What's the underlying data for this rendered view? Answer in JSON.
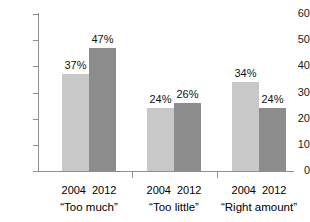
{
  "chart_data": {
    "type": "bar",
    "title": "",
    "subtitle": "",
    "xlabel": "",
    "ylabel": "",
    "ylim": [
      0,
      60
    ],
    "ytick_labels": [
      "0",
      "10",
      "20",
      "30",
      "40",
      "50",
      "60"
    ],
    "ytick_values": [
      0,
      10,
      20,
      30,
      40,
      50,
      60
    ],
    "grid": false,
    "legend_position": "none",
    "categories": [
      "“Too much”",
      "“Too little”",
      "“Right amount”"
    ],
    "series": [
      {
        "name": "2004",
        "color": "#c8c8c8",
        "values": [
          37,
          24,
          34
        ],
        "data_labels": [
          "37%",
          "24%",
          "34%"
        ]
      },
      {
        "name": "2012",
        "color": "#8c8c8c",
        "values": [
          47,
          26,
          24
        ],
        "data_labels": [
          "47%",
          "26%",
          "24%"
        ]
      }
    ],
    "groups": [
      {
        "category": "“Too much”",
        "bars": [
          {
            "series": "2004",
            "value": 37,
            "label": "37%"
          },
          {
            "series": "2012",
            "value": 47,
            "label": "47%"
          }
        ]
      },
      {
        "category": "“Too little”",
        "bars": [
          {
            "series": "2004",
            "value": 24,
            "label": "24%"
          },
          {
            "series": "2012",
            "value": 26,
            "label": "26%"
          }
        ]
      },
      {
        "category": "“Right amount”",
        "bars": [
          {
            "series": "2004",
            "value": 34,
            "label": "34%"
          },
          {
            "series": "2012",
            "value": 24,
            "label": "24%"
          }
        ]
      }
    ],
    "axis_color": "#8f8f8f",
    "text_color": "#1a1a1a",
    "background": "#ffffff"
  }
}
